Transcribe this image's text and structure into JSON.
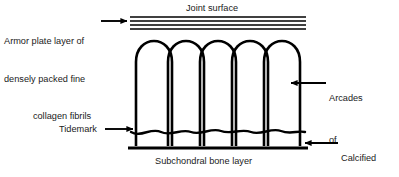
{
  "figure": {
    "background_color": "#ffffff",
    "line_color": "#000000",
    "text_color": "#1a1a1a"
  },
  "labels": {
    "armor_plate": {
      "line1": "Armor plate layer of",
      "line2": "densely packed fine",
      "line3": "collagen fibrils"
    },
    "joint_surface": "Joint surface",
    "arcades": {
      "line1": "Arcades",
      "line2": "of",
      "line3": "Benninghoff"
    },
    "tidemark": "Tidemark",
    "calcified": {
      "line1": "Calcified",
      "line2": "cartilage",
      "line3": "layer"
    },
    "subchondral": "Subchondral bone layer"
  },
  "diagram": {
    "armor_plate_line_count": 4,
    "arcade_count": 5,
    "tidemark_style": "wavy-line",
    "subchondral_style": "thick-straight-line",
    "structure_left_x": 130,
    "structure_right_x": 306,
    "arrow_style": "solid-triangle-head"
  }
}
